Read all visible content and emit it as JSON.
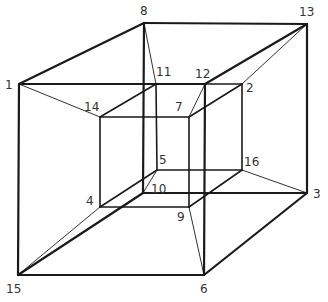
{
  "diagram": {
    "line_color": "#1a1a1a",
    "label_color": "#333333",
    "vertices": [
      {
        "id": "1",
        "label": "1"
      },
      {
        "id": "2",
        "label": "2"
      },
      {
        "id": "3",
        "label": "3"
      },
      {
        "id": "4",
        "label": "4"
      },
      {
        "id": "5",
        "label": "5"
      },
      {
        "id": "6",
        "label": "6"
      },
      {
        "id": "7",
        "label": "7"
      },
      {
        "id": "8",
        "label": "8"
      },
      {
        "id": "9",
        "label": "9"
      },
      {
        "id": "10",
        "label": "10"
      },
      {
        "id": "11",
        "label": "11"
      },
      {
        "id": "12",
        "label": "12"
      },
      {
        "id": "13",
        "label": "13"
      },
      {
        "id": "14",
        "label": "14"
      },
      {
        "id": "15",
        "label": "15"
      },
      {
        "id": "16",
        "label": "16"
      }
    ],
    "edges": [
      {
        "from": "1",
        "to": "12",
        "group": "outer"
      },
      {
        "from": "12",
        "to": "6",
        "group": "outer"
      },
      {
        "from": "6",
        "to": "15",
        "group": "outer"
      },
      {
        "from": "15",
        "to": "1",
        "group": "outer"
      },
      {
        "from": "8",
        "to": "13",
        "group": "outer"
      },
      {
        "from": "13",
        "to": "3",
        "group": "outer"
      },
      {
        "from": "3",
        "to": "10",
        "group": "outer"
      },
      {
        "from": "10",
        "to": "8",
        "group": "outer"
      },
      {
        "from": "1",
        "to": "8",
        "group": "outer"
      },
      {
        "from": "12",
        "to": "13",
        "group": "outer"
      },
      {
        "from": "6",
        "to": "3",
        "group": "outer"
      },
      {
        "from": "15",
        "to": "10",
        "group": "outer"
      },
      {
        "from": "14",
        "to": "7",
        "group": "inner"
      },
      {
        "from": "7",
        "to": "9",
        "group": "inner"
      },
      {
        "from": "9",
        "to": "4",
        "group": "inner"
      },
      {
        "from": "4",
        "to": "14",
        "group": "inner"
      },
      {
        "from": "11",
        "to": "2",
        "group": "inner"
      },
      {
        "from": "2",
        "to": "16",
        "group": "inner"
      },
      {
        "from": "16",
        "to": "5",
        "group": "inner"
      },
      {
        "from": "5",
        "to": "11",
        "group": "inner"
      },
      {
        "from": "14",
        "to": "11",
        "group": "inner"
      },
      {
        "from": "7",
        "to": "2",
        "group": "inner"
      },
      {
        "from": "9",
        "to": "16",
        "group": "inner"
      },
      {
        "from": "4",
        "to": "5",
        "group": "inner"
      },
      {
        "from": "1",
        "to": "14",
        "group": "connector"
      },
      {
        "from": "8",
        "to": "11",
        "group": "connector"
      },
      {
        "from": "12",
        "to": "7",
        "group": "connector"
      },
      {
        "from": "13",
        "to": "2",
        "group": "connector"
      },
      {
        "from": "3",
        "to": "16",
        "group": "connector"
      },
      {
        "from": "6",
        "to": "9",
        "group": "connector"
      },
      {
        "from": "15",
        "to": "4",
        "group": "connector"
      },
      {
        "from": "10",
        "to": "5",
        "group": "connector"
      }
    ]
  }
}
